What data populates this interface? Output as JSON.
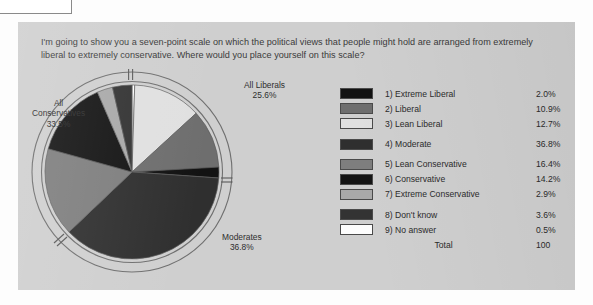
{
  "panel": {
    "background_color": "#cfcfcf",
    "question": "I'm going to show you a seven-point scale on which the political views that people might hold are arranged from extremely liberal to extremely conservative. Where would you place yourself on this scale?"
  },
  "pie_labels": [
    {
      "name": "all-liberals",
      "line1": "All Liberals",
      "line2": "25.6%"
    },
    {
      "name": "all-conservatives",
      "line1": "All",
      "line2": "Conservatives",
      "line3": "33.5%"
    },
    {
      "name": "moderates",
      "line1": "Moderates",
      "line2": "36.8%"
    }
  ],
  "legend": {
    "rows": [
      {
        "label": "1) Extreme Liberal",
        "value": "2.0%",
        "color": "#121212",
        "gap_above": false
      },
      {
        "label": "2) Liberal",
        "value": "10.9%",
        "color": "#6e6e6e",
        "gap_above": false
      },
      {
        "label": "3) Lean Liberal",
        "value": "12.7%",
        "color": "#e0e0e0",
        "gap_above": false
      },
      {
        "label": "4) Moderate",
        "value": "36.8%",
        "color": "#2f2f2f",
        "gap_above": true
      },
      {
        "label": "5) Lean Conservative",
        "value": "16.4%",
        "color": "#7e7e7e",
        "gap_above": true
      },
      {
        "label": "6) Conservative",
        "value": "14.2%",
        "color": "#141414",
        "gap_above": false
      },
      {
        "label": "7) Extreme Conservative",
        "value": "2.9%",
        "color": "#a9a9a9",
        "gap_above": false
      },
      {
        "label": "8) Don't know",
        "value": "3.6%",
        "color": "#333333",
        "gap_above": true
      },
      {
        "label": "9) No answer",
        "value": "0.5%",
        "color": "#fdfdfd",
        "gap_above": false
      }
    ],
    "total_label": "Total",
    "total_value": "100"
  },
  "chart_data": {
    "type": "pie",
    "categories": [
      "1) Extreme Liberal",
      "2) Liberal",
      "3) Lean Liberal",
      "4) Moderate",
      "5) Lean Conservative",
      "6) Conservative",
      "7) Extreme Conservative",
      "8) Don't know",
      "9) No answer"
    ],
    "values": [
      2.0,
      10.9,
      12.7,
      36.8,
      16.4,
      14.2,
      2.9,
      3.6,
      0.5
    ],
    "unit": "percent",
    "total": 100,
    "colors": [
      "#121212",
      "#6e6e6e",
      "#e0e0e0",
      "#2f2f2f",
      "#7e7e7e",
      "#141414",
      "#a9a9a9",
      "#333333",
      "#fdfdfd"
    ],
    "slice_order_clockwise_from_top": [
      "9) No answer",
      "3) Lean Liberal",
      "2) Liberal",
      "1) Extreme Liberal",
      "4) Moderate",
      "5) Lean Conservative",
      "6) Conservative",
      "7) Extreme Conservative",
      "8) Don't know"
    ],
    "groups": [
      {
        "name": "All Liberals",
        "value": 25.6,
        "members": [
          "1) Extreme Liberal",
          "2) Liberal",
          "3) Lean Liberal"
        ]
      },
      {
        "name": "Moderates",
        "value": 36.8,
        "members": [
          "4) Moderate"
        ]
      },
      {
        "name": "All Conservatives",
        "value": 33.5,
        "members": [
          "5) Lean Conservative",
          "6) Conservative",
          "7) Extreme Conservative"
        ]
      }
    ],
    "legend_position": "right",
    "grid": false
  }
}
